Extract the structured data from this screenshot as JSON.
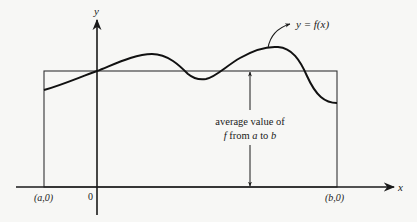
{
  "diagram": {
    "axes": {
      "x_label": "x",
      "y_label": "y",
      "origin_label": "0"
    },
    "points": {
      "a_label": "(a,0)",
      "b_label": "(b,0)"
    },
    "curve_label": "y = f(x)",
    "annotation": {
      "line1": "average value of",
      "line2_f": "f",
      "line2_from": " from ",
      "line2_a": "a",
      "line2_to": " to ",
      "line2_b": "b"
    },
    "colors": {
      "ink": "#1a1a1a",
      "rect": "#333333",
      "background": "#f7f7f5"
    }
  }
}
